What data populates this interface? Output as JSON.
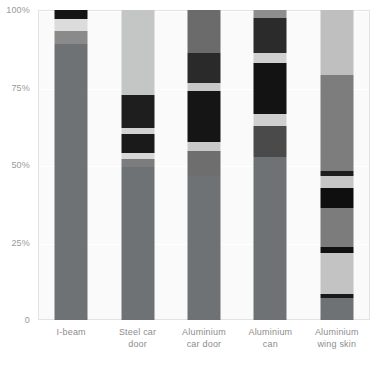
{
  "chart_data": {
    "type": "bar",
    "title": "",
    "subtitle": "",
    "xlabel": "",
    "ylabel": "",
    "stacked": true,
    "normalized_percent": true,
    "grid": true,
    "legend_position": "none",
    "ylim": [
      0,
      100
    ],
    "yticks": [
      "0",
      "25%",
      "50%",
      "75%",
      "100%"
    ],
    "ytick_values": [
      0,
      25,
      50,
      75,
      100
    ],
    "categories": [
      "I-beam",
      "Steel car door",
      "Aluminium car door",
      "Aluminium can",
      "Aluminium wing skin"
    ],
    "category_lines": [
      [
        "I-beam"
      ],
      [
        "Steel car",
        "door"
      ],
      [
        "Aluminium",
        "car door"
      ],
      [
        "Aluminium",
        "can"
      ],
      [
        "Aluminium",
        "wing skin"
      ]
    ],
    "series": [
      {
        "name": "segment-1",
        "color": "#6f6f6f",
        "values": [
          89.0,
          51.0,
          43.5,
          34.0,
          9.0
        ]
      },
      {
        "name": "segment-2",
        "color": "#808080",
        "values": [
          4.0,
          4.0,
          7.5,
          10.0,
          3.0
        ]
      },
      {
        "name": "segment-3",
        "color": "#d6d6d6",
        "values": [
          4.0,
          2.0,
          2.0,
          3.0,
          20.0
        ]
      },
      {
        "name": "segment-4",
        "color": "#1c1c1c",
        "values": [
          3.0,
          8.0,
          17.0,
          20.0,
          2.0
        ]
      },
      {
        "name": "segment-5",
        "color": "#c9c9c9",
        "values": [
          0.0,
          2.0,
          2.0,
          3.0,
          22.0
        ]
      },
      {
        "name": "segment-6",
        "color": "#262626",
        "values": [
          0.0,
          10.0,
          7.0,
          9.0,
          7.0
        ]
      },
      {
        "name": "segment-7",
        "color": "#b4b4b4",
        "values": [
          0.0,
          0.0,
          2.0,
          2.0,
          2.0
        ]
      },
      {
        "name": "segment-8",
        "color": "#9a9a9a",
        "values": [
          0.0,
          23.0,
          19.0,
          19.0,
          35.0
        ]
      }
    ],
    "bars": [
      {
        "category": "I-beam",
        "segments": [
          {
            "label": "top-black-cap",
            "color": "#141414",
            "from": 97.0,
            "to": 100.0
          },
          {
            "label": "light-band",
            "color": "#dcdcdc",
            "from": 93.2,
            "to": 97.0
          },
          {
            "label": "dark-band",
            "color": "#8a8a8a",
            "from": 89.0,
            "to": 93.2
          },
          {
            "label": "main-body",
            "color": "#6f7274",
            "from": 0.0,
            "to": 89.0
          }
        ]
      },
      {
        "category": "Steel car door",
        "segments": [
          {
            "label": "light-top",
            "color": "#c4c6c6",
            "from": 72.5,
            "to": 100.0
          },
          {
            "label": "dark-block-1",
            "color": "#1e1e1e",
            "from": 62.0,
            "to": 72.5
          },
          {
            "label": "light-sliver-1",
            "color": "#d2d2d2",
            "from": 60.0,
            "to": 62.0
          },
          {
            "label": "dark-block-2",
            "color": "#1a1a1a",
            "from": 54.0,
            "to": 60.0
          },
          {
            "label": "light-sliver-2",
            "color": "#d8d8d8",
            "from": 52.0,
            "to": 54.0
          },
          {
            "label": "mid-gray-band",
            "color": "#7c7c7c",
            "from": 49.5,
            "to": 52.0
          },
          {
            "label": "main-body",
            "color": "#6f7274",
            "from": 0.0,
            "to": 49.5
          }
        ]
      },
      {
        "category": "Aluminium car door",
        "segments": [
          {
            "label": "mid-gray-top",
            "color": "#6b6b6b",
            "from": 86.0,
            "to": 100.0
          },
          {
            "label": "dark-block-1",
            "color": "#2a2a2a",
            "from": 76.5,
            "to": 86.0
          },
          {
            "label": "light-sliver-1",
            "color": "#c8c8c8",
            "from": 74.0,
            "to": 76.5
          },
          {
            "label": "dark-block-2",
            "color": "#151515",
            "from": 57.5,
            "to": 74.0
          },
          {
            "label": "light-sliver-2",
            "color": "#cacaca",
            "from": 54.5,
            "to": 57.5
          },
          {
            "label": "mid-gray-band",
            "color": "#6e6e6e",
            "from": 46.5,
            "to": 54.5
          },
          {
            "label": "main-body",
            "color": "#6f7274",
            "from": 0.0,
            "to": 46.5
          }
        ]
      },
      {
        "category": "Aluminium can",
        "segments": [
          {
            "label": "gray-cap",
            "color": "#8e8e8e",
            "from": 97.5,
            "to": 100.0
          },
          {
            "label": "dark-block-1",
            "color": "#2b2b2b",
            "from": 86.0,
            "to": 97.5
          },
          {
            "label": "light-sliver-1",
            "color": "#d0d0d0",
            "from": 83.0,
            "to": 86.0
          },
          {
            "label": "dark-block-2",
            "color": "#131313",
            "from": 66.5,
            "to": 83.0
          },
          {
            "label": "light-sliver-2",
            "color": "#cfcfcf",
            "from": 62.5,
            "to": 66.5
          },
          {
            "label": "dark-gray-band",
            "color": "#4a4a4a",
            "from": 52.5,
            "to": 62.5
          },
          {
            "label": "main-body",
            "color": "#6f7274",
            "from": 0.0,
            "to": 52.5
          }
        ]
      },
      {
        "category": "Aluminium wing skin",
        "segments": [
          {
            "label": "light-top",
            "color": "#bfbfbf",
            "from": 79.0,
            "to": 100.0
          },
          {
            "label": "mid-gray-1",
            "color": "#7d7d7d",
            "from": 48.0,
            "to": 79.0
          },
          {
            "label": "dark-line-1",
            "color": "#1d1d1d",
            "from": 46.5,
            "to": 48.0
          },
          {
            "label": "light-band-1",
            "color": "#c6c6c6",
            "from": 42.5,
            "to": 46.5
          },
          {
            "label": "dark-block",
            "color": "#0f0f0f",
            "from": 36.0,
            "to": 42.5
          },
          {
            "label": "mid-gray-2",
            "color": "#7c7c7c",
            "from": 23.5,
            "to": 36.0
          },
          {
            "label": "dark-line-2",
            "color": "#111111",
            "from": 21.5,
            "to": 23.5
          },
          {
            "label": "light-band-2",
            "color": "#c3c3c3",
            "from": 8.5,
            "to": 21.5
          },
          {
            "label": "dark-line-3",
            "color": "#1a1a1a",
            "from": 7.0,
            "to": 8.5
          },
          {
            "label": "main-body",
            "color": "#6f7274",
            "from": 0.0,
            "to": 7.0
          }
        ]
      }
    ],
    "annotations": {
      "footer_caption": ""
    }
  },
  "colors": {
    "plot_background": "#fafafa",
    "plot_border": "#e3e3e3",
    "gridline": "#ffffff",
    "axis_text": "#9a9a9a",
    "label_text": "#8d8d8d"
  }
}
